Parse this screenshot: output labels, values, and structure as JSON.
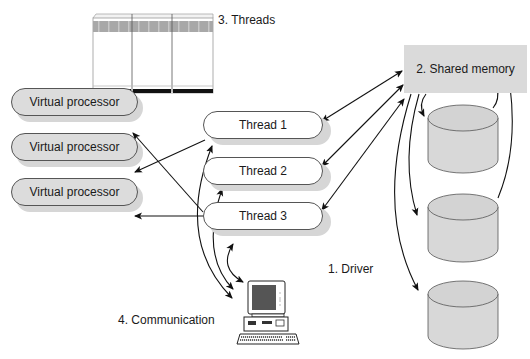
{
  "diagram": {
    "labels": {
      "threads": "3. Threads",
      "shared_memory": "2. Shared memory",
      "driver": "1. Driver",
      "communication": "4. Communication"
    },
    "virtual_processors": [
      {
        "label": "Virtual processor"
      },
      {
        "label": "Virtual processor"
      },
      {
        "label": "Virtual processor"
      }
    ],
    "threads": [
      {
        "label": "Thread 1"
      },
      {
        "label": "Thread 2"
      },
      {
        "label": "Thread 3"
      }
    ],
    "disks": [
      {
        "name": "disk-1"
      },
      {
        "name": "disk-2"
      },
      {
        "name": "disk-3"
      }
    ],
    "connections": [
      {
        "from": "Thread 1",
        "to": "Virtual processor 2",
        "type": "one-way"
      },
      {
        "from": "Thread 3",
        "to": "Virtual processor 1",
        "type": "one-way"
      },
      {
        "from": "Thread 3",
        "to": "Virtual processor 3",
        "type": "one-way"
      },
      {
        "from": "Thread 1",
        "to": "Shared memory",
        "type": "two-way"
      },
      {
        "from": "Thread 2",
        "to": "Shared memory",
        "type": "two-way"
      },
      {
        "from": "Thread 3",
        "to": "Shared memory",
        "type": "two-way"
      },
      {
        "from": "Shared memory",
        "to": "Disk 1",
        "type": "two-way"
      },
      {
        "from": "Shared memory",
        "to": "Disk 2",
        "type": "two-way"
      },
      {
        "from": "Shared memory",
        "to": "Disk 3",
        "type": "two-way"
      },
      {
        "from": "Computer",
        "to": "Thread 1",
        "type": "two-way"
      },
      {
        "from": "Computer",
        "to": "Thread 2",
        "type": "two-way"
      },
      {
        "from": "Computer",
        "to": "Thread 3",
        "type": "two-way"
      }
    ],
    "colors": {
      "box_fill": "#dadada",
      "thread_fill": "#ffffff",
      "shadow": "#d6d6d6",
      "line": "#111111"
    }
  }
}
